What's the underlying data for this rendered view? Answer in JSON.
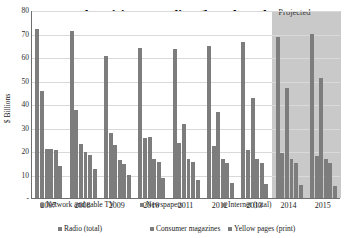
{
  "chart_data": {
    "type": "bar",
    "title": "US Advertising Spending (by selected media)",
    "xlabel": "",
    "ylabel": "$ Billions",
    "ylim": [
      0,
      80
    ],
    "ytick_labels": [
      "80",
      "70",
      "60",
      "50",
      "40",
      "30",
      "20",
      "10",
      "-"
    ],
    "ytick_values": [
      80,
      70,
      60,
      50,
      40,
      30,
      20,
      10,
      0
    ],
    "grid": true,
    "legend_position": "bottom",
    "categories": [
      "2007",
      "2008",
      "2009",
      "2010",
      "2011",
      "2012",
      "2013",
      "2014",
      "2015"
    ],
    "series": [
      {
        "name": "Network and cable TV",
        "values": [
          72.0,
          71.0,
          60.5,
          64.0,
          63.5,
          64.5,
          66.5,
          68.5,
          70.0
        ]
      },
      {
        "name": "Newspapers",
        "values": [
          45.5,
          37.5,
          27.5,
          25.5,
          23.5,
          22.0,
          20.5,
          19.0,
          18.0
        ]
      },
      {
        "name": "Internet (total)",
        "values": [
          21.0,
          23.0,
          22.5,
          26.0,
          31.5,
          36.5,
          42.5,
          47.0,
          51.0
        ]
      },
      {
        "name": "Radio (total)",
        "values": [
          21.0,
          19.5,
          16.0,
          16.5,
          16.5,
          16.5,
          16.5,
          16.5,
          16.5
        ]
      },
      {
        "name": "Consumer magazines",
        "values": [
          20.5,
          18.5,
          14.5,
          15.5,
          15.5,
          15.0,
          15.0,
          15.0,
          15.0
        ]
      },
      {
        "name": "Yellow pages (print)",
        "values": [
          13.5,
          12.5,
          10.0,
          8.5,
          7.5,
          6.5,
          6.0,
          5.5,
          5.0
        ]
      }
    ],
    "annotations": [
      {
        "text": "Projected",
        "covers": [
          "2014",
          "2015"
        ]
      }
    ]
  },
  "annotation": {
    "projected_label": "Projected"
  },
  "colors": {
    "bar": "#7d7d7d",
    "projected_band": "#b4b4b4",
    "grid": "#d9d9d9",
    "axis": "#6f6f6f",
    "text": "#1d1d1d"
  }
}
